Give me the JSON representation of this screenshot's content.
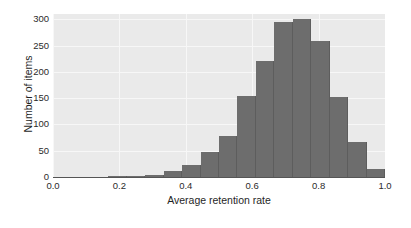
{
  "chart_data": {
    "type": "bar",
    "title": "",
    "subtitle": "",
    "xlabel": "Average retention rate",
    "ylabel": "Number of items",
    "xlim": [
      0.0,
      1.0
    ],
    "ylim": [
      0,
      310
    ],
    "grid": true,
    "legend": null,
    "style": {
      "bar_color": "#6d6d6d",
      "bar_edge_color": "#5d5d5d",
      "plot_background": "#eaeaea",
      "gridline_color": "#f7f7f7",
      "figure_background": "#ffffff",
      "axis_color": "#555555",
      "text_color": "#1f1f1f"
    },
    "xticks": [
      "0.0",
      "0.2",
      "0.4",
      "0.6",
      "0.8",
      "1.0"
    ],
    "xtick_values": [
      0.0,
      0.2,
      0.4,
      0.6,
      0.8,
      1.0
    ],
    "yticks": [
      "0",
      "50",
      "100",
      "150",
      "200",
      "250",
      "300"
    ],
    "ytick_values": [
      0,
      50,
      100,
      150,
      200,
      250,
      300
    ],
    "bin_width": 0.0556,
    "bins": [
      {
        "x0": 0.1667,
        "x1": 0.2222,
        "value": 1
      },
      {
        "x0": 0.2222,
        "x1": 0.2778,
        "value": 1
      },
      {
        "x0": 0.2778,
        "x1": 0.3333,
        "value": 4
      },
      {
        "x0": 0.3333,
        "x1": 0.3889,
        "value": 12
      },
      {
        "x0": 0.3889,
        "x1": 0.4444,
        "value": 22
      },
      {
        "x0": 0.4444,
        "x1": 0.5,
        "value": 48
      },
      {
        "x0": 0.5,
        "x1": 0.5556,
        "value": 78
      },
      {
        "x0": 0.5556,
        "x1": 0.6111,
        "value": 155
      },
      {
        "x0": 0.6111,
        "x1": 0.6667,
        "value": 221
      },
      {
        "x0": 0.6667,
        "x1": 0.7222,
        "value": 294
      },
      {
        "x0": 0.7222,
        "x1": 0.7778,
        "value": 301
      },
      {
        "x0": 0.7778,
        "x1": 0.8333,
        "value": 258
      },
      {
        "x0": 0.8333,
        "x1": 0.8889,
        "value": 152
      },
      {
        "x0": 0.8889,
        "x1": 0.9444,
        "value": 66
      },
      {
        "x0": 0.9444,
        "x1": 1.0,
        "value": 16
      },
      {
        "x0": 1.0,
        "x1": 1.0556,
        "value": 4
      }
    ],
    "categories": [
      "0.19",
      "0.25",
      "0.31",
      "0.36",
      "0.42",
      "0.47",
      "0.53",
      "0.58",
      "0.64",
      "0.69",
      "0.75",
      "0.81",
      "0.86",
      "0.92",
      "0.97",
      "1.03"
    ],
    "values": [
      1,
      1,
      4,
      12,
      22,
      48,
      78,
      155,
      221,
      294,
      301,
      258,
      152,
      66,
      16,
      4
    ]
  }
}
